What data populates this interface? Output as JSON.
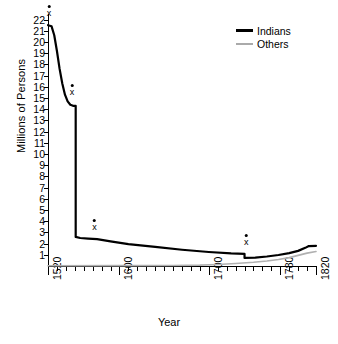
{
  "chart_data": {
    "type": "line",
    "title": "",
    "xlabel": "Year",
    "ylabel": "Millions of Persons",
    "xlim": [
      1520,
      1820
    ],
    "ylim": [
      0,
      22.5
    ],
    "grid": false,
    "legend_position": "top-right",
    "y_ticks": [
      1,
      2,
      3,
      4,
      5,
      6,
      7,
      8,
      9,
      10,
      11,
      12,
      13,
      14,
      15,
      16,
      17,
      18,
      19,
      20,
      21,
      22
    ],
    "x_ticks_major": [
      1520,
      1600,
      1700,
      1780,
      1820
    ],
    "x_tick_labels": [
      "1520",
      "1600",
      "1700",
      "1780",
      "1820"
    ],
    "x_minor_step": 10,
    "series": [
      {
        "name": "Indians",
        "color": "#000000",
        "width": 2.2,
        "points": [
          [
            1520,
            21.5
          ],
          [
            1524,
            21.4
          ],
          [
            1527,
            20.6
          ],
          [
            1530,
            19.2
          ],
          [
            1533,
            17.6
          ],
          [
            1536,
            16.3
          ],
          [
            1539,
            15.3
          ],
          [
            1542,
            14.7
          ],
          [
            1545,
            14.4
          ],
          [
            1548,
            14.3
          ],
          [
            1551,
            14.3
          ],
          [
            1551,
            8.0
          ],
          [
            1551,
            2.6
          ],
          [
            1556,
            2.5
          ],
          [
            1565,
            2.45
          ],
          [
            1575,
            2.4
          ],
          [
            1590,
            2.2
          ],
          [
            1610,
            1.95
          ],
          [
            1640,
            1.7
          ],
          [
            1670,
            1.45
          ],
          [
            1700,
            1.25
          ],
          [
            1725,
            1.12
          ],
          [
            1740,
            1.08
          ],
          [
            1740,
            0.72
          ],
          [
            1752,
            0.75
          ],
          [
            1765,
            0.85
          ],
          [
            1778,
            0.98
          ],
          [
            1790,
            1.15
          ],
          [
            1800,
            1.35
          ],
          [
            1808,
            1.62
          ],
          [
            1812,
            1.78
          ],
          [
            1820,
            1.8
          ]
        ]
      },
      {
        "name": "Others",
        "color": "#b0b0b0",
        "width": 1.6,
        "points": [
          [
            1520,
            0.02
          ],
          [
            1600,
            0.03
          ],
          [
            1660,
            0.05
          ],
          [
            1690,
            0.08
          ],
          [
            1710,
            0.14
          ],
          [
            1730,
            0.22
          ],
          [
            1750,
            0.33
          ],
          [
            1765,
            0.45
          ],
          [
            1778,
            0.58
          ],
          [
            1790,
            0.75
          ],
          [
            1800,
            0.95
          ],
          [
            1810,
            1.15
          ],
          [
            1820,
            1.3
          ]
        ]
      }
    ],
    "annotations": [
      {
        "label": "x",
        "x": 1521,
        "y": 22.4
      },
      {
        "label": "x",
        "x": 1547,
        "y": 15.4
      },
      {
        "label": "x",
        "x": 1572,
        "y": 3.3
      },
      {
        "label": "x",
        "x": 1742,
        "y": 1.95
      }
    ]
  },
  "legend": {
    "items": [
      {
        "label": "Indians"
      },
      {
        "label": "Others"
      }
    ]
  },
  "colors": {
    "indians": "#000000",
    "others": "#b0b0b0",
    "axis": "#000000",
    "background": "#ffffff"
  }
}
